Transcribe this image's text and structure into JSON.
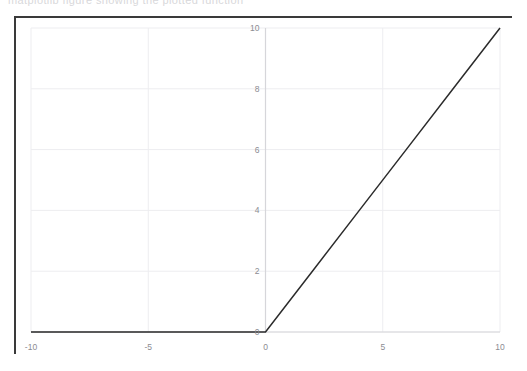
{
  "caption": {
    "text": "matplotlib figure showing the plotted function"
  },
  "figure": {
    "frame_color": "#3a3a3a",
    "background_color": "#ffffff",
    "grid_color": "#ededf0",
    "axis_color": "#d6d6da",
    "line_color": "#2b2b2b",
    "tick_label_color": "#8c8c92"
  },
  "chart_data": {
    "type": "line",
    "title": "",
    "subtitle": "",
    "xlabel": "",
    "ylabel": "",
    "xlim": [
      -10,
      10
    ],
    "ylim": [
      0,
      10
    ],
    "xticks": [
      -10,
      -5,
      0,
      5,
      10
    ],
    "xticklabels": [
      "-10",
      "-5",
      "0",
      "5",
      "10"
    ],
    "yticks": [
      0,
      2,
      4,
      6,
      8,
      10
    ],
    "yticklabels": [
      "0",
      "2",
      "4",
      "6",
      "8",
      "10"
    ],
    "grid": true,
    "legend": null,
    "legend_position": "none",
    "annotations": [],
    "series": [
      {
        "name": "y = x for x >= 0",
        "color": "#2b2b2b",
        "linewidth": 1.5,
        "x": [
          -10,
          -8,
          -6,
          -4,
          -2,
          0,
          2,
          4,
          6,
          8,
          10
        ],
        "y": [
          0,
          0,
          0,
          0,
          0,
          0,
          2,
          4,
          6,
          8,
          10
        ]
      }
    ]
  }
}
